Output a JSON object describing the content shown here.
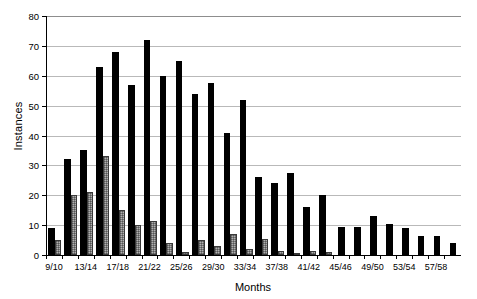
{
  "chart_data": {
    "type": "bar",
    "title": "",
    "xlabel": "Months",
    "ylabel": "Instances",
    "ylim": [
      0,
      80
    ],
    "ytick_step": 10,
    "yticks": [
      0,
      10,
      20,
      30,
      40,
      50,
      60,
      70,
      80
    ],
    "grid": true,
    "legend": "none",
    "categories": [
      "9/10",
      "11/12",
      "13/14",
      "15/16",
      "17/18",
      "19/20",
      "21/22",
      "23/24",
      "25/26",
      "27/28",
      "29/30",
      "31/32",
      "33/34",
      "35/36",
      "37/38",
      "39/40",
      "41/42",
      "43/44",
      "45/46",
      "47/48",
      "49/50",
      "51/52",
      "53/54",
      "55/56",
      "57/58",
      "59/60"
    ],
    "tick_labels": [
      "9/10",
      "",
      "13/14",
      "",
      "17/18",
      "",
      "21/22",
      "",
      "25/26",
      "",
      "29/30",
      "",
      "33/34",
      "",
      "37/38",
      "",
      "41/42",
      "",
      "45/46",
      "",
      "49/50",
      "",
      "53/54",
      "",
      "57/58",
      ""
    ],
    "series": [
      {
        "name": "Series 1",
        "color": "#000000",
        "style": "solid-black",
        "values": [
          9,
          32,
          35,
          63,
          68,
          57,
          72,
          60,
          65,
          54,
          57.5,
          41,
          52,
          26,
          24,
          27.5,
          16,
          20,
          9.5,
          9.5,
          13,
          10.5,
          9,
          6.5,
          6.5,
          4
        ]
      },
      {
        "name": "Series 2",
        "color": "#b0b0b0",
        "style": "gray-hatched",
        "values": [
          5,
          20,
          21,
          33,
          15,
          10,
          11.5,
          4,
          1,
          5,
          3,
          7,
          2,
          5.5,
          1.5,
          0.3,
          1.5,
          1,
          0,
          0,
          0,
          0,
          0,
          0,
          0,
          0
        ]
      }
    ]
  }
}
